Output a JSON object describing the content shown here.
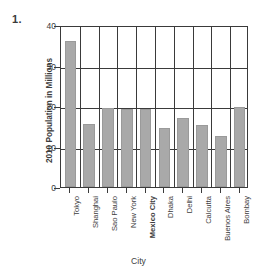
{
  "problem_number": "1.",
  "chart_data": {
    "type": "bar",
    "title": "",
    "xlabel": "City",
    "ylabel": "2010 Population in Millions",
    "categories": [
      "Tokyo",
      "Shanghai",
      "Sao Paulo",
      "New York",
      "Mexico City",
      "Dhaka",
      "Delhi",
      "Calcutta",
      "Buenos Aires",
      "Bombay"
    ],
    "values": [
      36.0,
      15.5,
      19.6,
      19.2,
      19.3,
      14.6,
      17.0,
      15.2,
      12.7,
      19.8
    ],
    "ylim": [
      0,
      40
    ],
    "yticks": [
      "0",
      "10",
      "20",
      "30",
      "40"
    ],
    "ytick_values": [
      0,
      10,
      20,
      30,
      40
    ],
    "grid": "horizontal-and-vertical",
    "legend": "none",
    "bar_color": "#a9a9a9",
    "axis_color": "#3a3a3a"
  }
}
